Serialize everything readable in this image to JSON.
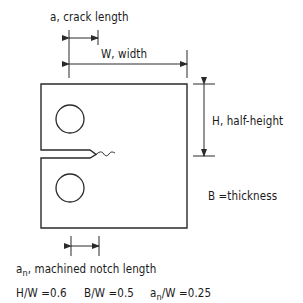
{
  "diagram": {
    "type": "compact-tension-specimen",
    "labels": {
      "crack_length": "a,  crack length",
      "width": "W,  width",
      "half_height": "H,  half-height",
      "thickness": "B =thickness",
      "notch_prefix": "a",
      "notch_sub": "n",
      "notch_text": ",  machined notch length"
    },
    "ratios": [
      {
        "text": "H/W =0.6"
      },
      {
        "text": "B/W =0.5"
      },
      {
        "prefix": "a",
        "sub": "n",
        "text": "/W =0.25"
      }
    ],
    "colors": {
      "line": "#2a2a2a",
      "text": "#1a1a1a",
      "background": "#ffffff"
    }
  }
}
